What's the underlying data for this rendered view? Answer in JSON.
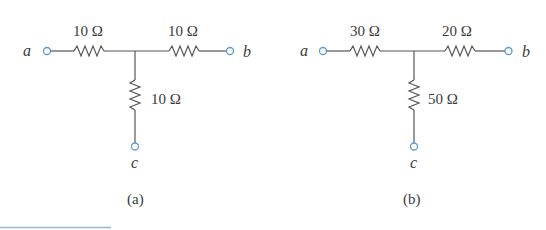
{
  "figure": {
    "circuits": [
      {
        "caption": "(a)",
        "terminals": {
          "a": "a",
          "b": "b",
          "c": "c"
        },
        "resistors": {
          "left": "10 Ω",
          "right": "10 Ω",
          "bottom": "10 Ω"
        }
      },
      {
        "caption": "(b)",
        "terminals": {
          "a": "a",
          "b": "b",
          "c": "c"
        },
        "resistors": {
          "left": "30 Ω",
          "right": "20 Ω",
          "bottom": "50 Ω"
        }
      }
    ]
  },
  "colors": {
    "wire": "#555555",
    "terminal": "#5b9bd5",
    "rule": "#8fb8dc",
    "text": "#3a3a3a"
  }
}
